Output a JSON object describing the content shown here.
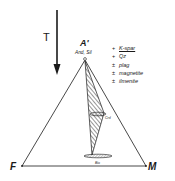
{
  "diagram": {
    "type": "AFM ternary phase diagram",
    "arrow": {
      "label": "T",
      "direction": "down"
    },
    "apex_top": {
      "label": "A'",
      "sublabel": "And, Sil"
    },
    "apex_left": {
      "label": "F"
    },
    "apex_right": {
      "label": "M"
    },
    "phases": [
      {
        "name": "Crd",
        "shape": "ellipse",
        "position": "mid-right of tie triangle"
      },
      {
        "name": "Bio",
        "shape": "ellipse",
        "position": "bottom of tie triangle"
      }
    ],
    "tie_triangle": {
      "fill": "hatched",
      "vertices": [
        "A'",
        "Crd",
        "Bio"
      ]
    },
    "legend": [
      {
        "symbol": "+",
        "label": "K-spar",
        "underlined": true
      },
      {
        "symbol": "+",
        "label": "Qz",
        "underlined": false
      },
      {
        "symbol": "±",
        "label": "plag",
        "underlined": false
      },
      {
        "symbol": "±",
        "label": "magnetite",
        "underlined": false
      },
      {
        "symbol": "±",
        "label": "ilmenite",
        "underlined": false
      }
    ]
  }
}
